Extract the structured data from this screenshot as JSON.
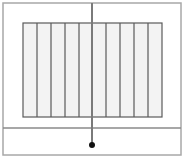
{
  "diagram": {
    "canvas": {
      "width": 185,
      "height": 161,
      "background": "#ffffff"
    },
    "outer_frame": {
      "x": 3,
      "y": 3,
      "width": 178,
      "height": 152,
      "stroke": "#a8a8a8",
      "stroke_width": 1.5
    },
    "divider_line": {
      "y": 128,
      "x1": 3,
      "x2": 181,
      "stroke": "#8a8a8a",
      "stroke_width": 1.5
    },
    "striped_panel": {
      "x": 23,
      "y": 23,
      "width": 139,
      "height": 94,
      "fill": "#f3f3f3",
      "stroke": "#5a5a5a",
      "stroke_width": 1.2,
      "stripe_lines_x": [
        37,
        51,
        65,
        79,
        106,
        120,
        134,
        148
      ],
      "column_count": 10
    },
    "rod": {
      "x": 92,
      "y1": 3,
      "y2": 145,
      "stroke": "#7a7a7a",
      "stroke_width": 2
    },
    "bob": {
      "cx": 92,
      "cy": 145,
      "r": 3,
      "fill": "#111111"
    }
  }
}
